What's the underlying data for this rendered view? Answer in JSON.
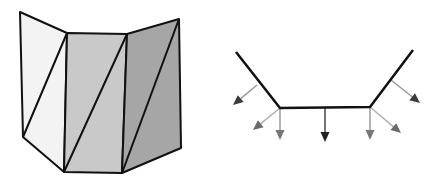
{
  "figure": {
    "left_diagram": {
      "description": "3D folded surface made of three quadrilateral panels, each split by a diagonal into two triangles",
      "stroke_color": "#111111",
      "panels": [
        {
          "name": "left-panel",
          "fill": "#f3f3f3",
          "points": [
            [
              20,
              12
            ],
            [
              67,
              33
            ],
            [
              64,
              172
            ],
            [
              23,
              137
            ]
          ],
          "diagonal": [
            [
              67,
              33
            ],
            [
              23,
              137
            ]
          ]
        },
        {
          "name": "middle-panel",
          "fill": "#c9c9c9",
          "points": [
            [
              67,
              33
            ],
            [
              127,
              34
            ],
            [
              122,
              173
            ],
            [
              64,
              172
            ]
          ],
          "diagonal": [
            [
              127,
              34
            ],
            [
              64,
              172
            ]
          ]
        },
        {
          "name": "right-panel",
          "fill": "#a6a6a6",
          "points": [
            [
              127,
              34
            ],
            [
              179,
              19
            ],
            [
              181,
              148
            ],
            [
              122,
              173
            ]
          ],
          "diagonal": [
            [
              179,
              19
            ],
            [
              122,
              173
            ]
          ]
        }
      ]
    },
    "right_diagram": {
      "description": "2D cross-section polyline with normal vectors",
      "stroke_color": "#111111",
      "polyline": [
        [
          236,
          52
        ],
        [
          280,
          108
        ],
        [
          370,
          107
        ],
        [
          413,
          50
        ]
      ],
      "arrows": [
        {
          "name": "face-normal-left",
          "from": [
            257,
            85
          ],
          "to": [
            233,
            105
          ],
          "shaft": "#9a9a9a",
          "head": "#3a3a3a"
        },
        {
          "name": "vertex-normal-left-diagonal",
          "from": [
            280,
            108
          ],
          "to": [
            253,
            130
          ],
          "shaft": "#b0b0b0",
          "head": "#6a6a6a"
        },
        {
          "name": "vertex-normal-left-vertical",
          "from": [
            280,
            108
          ],
          "to": [
            280,
            140
          ],
          "shaft": "#9a9a9a",
          "head": "#777777"
        },
        {
          "name": "face-normal-bottom",
          "from": [
            325,
            108
          ],
          "to": [
            325,
            142
          ],
          "shaft": "#444444",
          "head": "#222222"
        },
        {
          "name": "vertex-normal-right-vertical",
          "from": [
            370,
            107
          ],
          "to": [
            370,
            140
          ],
          "shaft": "#9a9a9a",
          "head": "#777777"
        },
        {
          "name": "vertex-normal-right-diagonal",
          "from": [
            370,
            107
          ],
          "to": [
            401,
            133
          ],
          "shaft": "#b0b0b0",
          "head": "#6a6a6a"
        },
        {
          "name": "face-normal-right",
          "from": [
            391,
            80
          ],
          "to": [
            420,
            103
          ],
          "shaft": "#9a9a9a",
          "head": "#3a3a3a"
        }
      ]
    }
  }
}
